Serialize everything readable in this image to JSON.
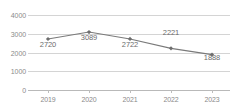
{
  "chart_data": {
    "type": "line",
    "title": "",
    "subtitle": "",
    "xlabel": "",
    "ylabel": "",
    "categories": [
      "2019",
      "2020",
      "2021",
      "2022",
      "2023"
    ],
    "values": [
      2720,
      3089,
      2722,
      2221,
      1888
    ],
    "data_labels": [
      "2720",
      "3089",
      "2722",
      "2221",
      "1888"
    ],
    "ylim": [
      0,
      4000
    ],
    "yticks": [
      4000,
      3000,
      2000,
      1000,
      0
    ],
    "ytick_labels": [
      "4000",
      "3000",
      "2000",
      "1000",
      "0"
    ],
    "grid": true,
    "legend": false,
    "legend_position": "none",
    "series": [
      {
        "name": "",
        "values": [
          2720,
          3089,
          2722,
          2221,
          1888
        ]
      }
    ],
    "colors": {
      "line": "#7a7a7a",
      "marker": "#6e6e6e",
      "grid": "#d4d4d4",
      "axis": "#b9b9b9",
      "tick_text": "#8a8a8a",
      "label_text": "#6b6b6b",
      "background": "#ffffff"
    },
    "marker_style": "diamond",
    "label_positions": [
      "below",
      "below",
      "below",
      "above",
      "below"
    ]
  }
}
